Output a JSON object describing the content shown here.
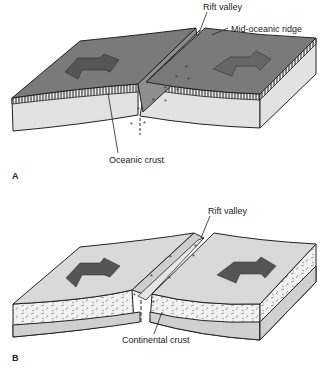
{
  "header": {
    "cutoff_text": "continental rifting and seafloor spreading"
  },
  "panel_a": {
    "letter": "A",
    "labels": {
      "rift_valley": "Rift valley",
      "ridge": "Mid-oceanic ridge",
      "crust": "Oceanic crust"
    },
    "colors": {
      "surface": "#7a7a7a",
      "side": "#e2e2e2",
      "arrow": "#555555"
    }
  },
  "panel_b": {
    "letter": "B",
    "labels": {
      "rift_valley": "Rift valley",
      "crust": "Continental crust"
    },
    "colors": {
      "surface": "#d9d9d9",
      "crust": "#f0f0f0",
      "base": "#d0d0d0",
      "arrow": "#555555"
    }
  }
}
